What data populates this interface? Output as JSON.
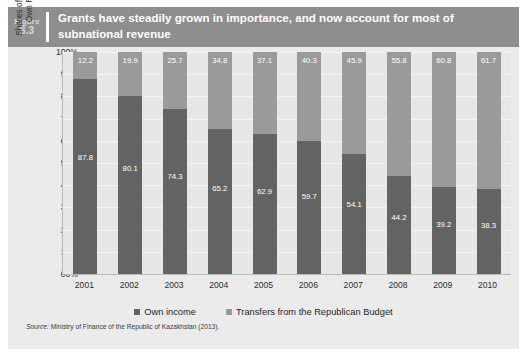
{
  "figure": {
    "label_word": "Figure",
    "number": "8.3",
    "title": "Grants have steadily grown in importance, and now account for most of subnational revenue"
  },
  "source": {
    "prefix": "Source:",
    "text": "Ministry of Finance of the Republic of Kazakhstan (2013)."
  },
  "colors": {
    "header_band": "#8e8e8e",
    "panel": "#ebebeb",
    "plot": "#e7e7e7",
    "own_income": "#636363",
    "transfers": "#9a9a9a",
    "title_text": "#ffffff"
  },
  "chart_data": {
    "type": "bar",
    "stacked": true,
    "title": "Grants have steadily grown in importance, and now account for most of subnational revenue",
    "xlabel": "",
    "ylabel": "Shares of Sub-national Government\nOwn Revenue and Transfers",
    "ylim": [
      0,
      100
    ],
    "ytick_labels": [
      "100%",
      "90%",
      "80%",
      "70%",
      "60%",
      "50%",
      "40%",
      "30%",
      "20%",
      "10%",
      "00%"
    ],
    "ytick_values": [
      100,
      90,
      80,
      70,
      60,
      50,
      40,
      30,
      20,
      10,
      0
    ],
    "grid": true,
    "legend_position": "bottom",
    "categories": [
      "2001",
      "2002",
      "2003",
      "2004",
      "2005",
      "2006",
      "2007",
      "2008",
      "2009",
      "2010"
    ],
    "series": [
      {
        "name": "Own income",
        "color": "#636363",
        "values": [
          87.8,
          80.1,
          74.3,
          65.2,
          62.9,
          59.7,
          54.1,
          44.2,
          39.2,
          38.3
        ]
      },
      {
        "name": "Transfers from the Republican Budget",
        "color": "#9a9a9a",
        "values": [
          12.2,
          19.9,
          25.7,
          34.8,
          37.1,
          40.3,
          45.9,
          55.8,
          60.8,
          61.7
        ]
      }
    ]
  }
}
